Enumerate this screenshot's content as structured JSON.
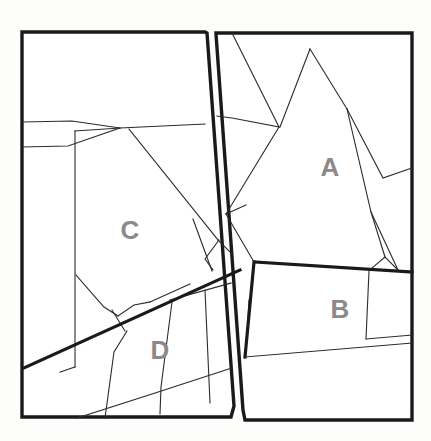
{
  "figure": {
    "background_color": "#fdfdfc",
    "panel_fill": "#ffffff",
    "line_color": "#2b2b2b",
    "thick_line_color": "#1a1a1a",
    "label_color": "#8a8a8a",
    "width": 431,
    "height": 441
  },
  "labels": {
    "a": "A",
    "b": "B",
    "c": "C",
    "d": "D"
  },
  "label_positions": {
    "a": {
      "x": 330,
      "y": 169
    },
    "b": {
      "x": 340,
      "y": 311
    },
    "c": {
      "x": 130,
      "y": 232
    },
    "d": {
      "x": 160,
      "y": 352
    }
  },
  "panels": {
    "left": {
      "name": "left-panel",
      "outline": "22,32 205,32 207,33 234,406 231,417 22,417"
    },
    "right": {
      "name": "right-panel",
      "outline": "216,33 412,33 412,420 245,420 243,410 216,34"
    }
  },
  "thin_lines": [
    "22,122 72,121 120,128 205,124",
    "120,128 68,146 22,147",
    "120,128 75,131 75,367",
    "120,128 127,129 218,240",
    "129,129 205,121 210,122",
    "126,129 225,270",
    "193,219 212,271",
    "75,367 60,372",
    "76,275 104,307 117,316",
    "117,316 133,306 147,303",
    "112,310 124,330",
    "219,240 205,258 213,269",
    "116,317 124,331",
    "148,303 189,285",
    "116,290 80,276",
    "121,310 140,300",
    "127,331 114,352 105,419",
    "172,302 160,388 159,414",
    "205,290 210,403",
    "77,418 150,394 231,370",
    "170,300 232,285",
    "150,394 232,366",
    "232,33 279,127",
    "279,127 226,214",
    "226,214 253,262",
    "279,127 232,118 217,116",
    "280,127 310,49",
    "310,49 346,109",
    "346,109 382,178 412,168",
    "346,109 372,213 398,270",
    "398,270 385,258 372,268",
    "372,268 369,213",
    "253,262 244,356",
    "369,271 366,338",
    "244,356 412,342",
    "366,338 412,334",
    "246,336 248,300"
  ],
  "thick_lines": [
    "24,368 240,270",
    "255,262 412,272",
    "253,262 244,356"
  ],
  "icons": {
    "region_marker": "polygon-region-icon"
  }
}
